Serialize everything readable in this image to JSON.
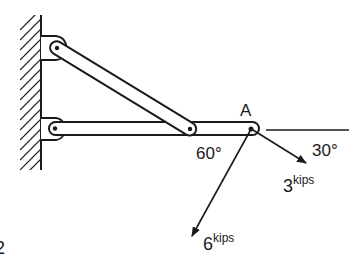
{
  "figure": {
    "point_label": "A",
    "angle_left": "60°",
    "angle_right": "30°",
    "force_1": {
      "value": "3",
      "unit": "kips"
    },
    "force_2": {
      "value": "6",
      "unit": "kips"
    },
    "corner_mark": "2"
  },
  "colors": {
    "ink": "#1a1a1a",
    "background": "#ffffff"
  }
}
